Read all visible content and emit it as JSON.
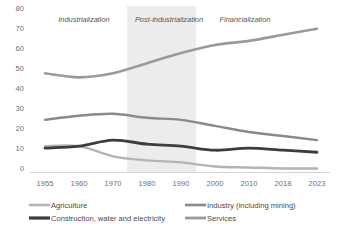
{
  "chart_data": {
    "type": "line",
    "title": "",
    "xlabel": "",
    "ylabel": "",
    "x": [
      "1955",
      "1960",
      "1970",
      "1980",
      "1990",
      "2000",
      "2010",
      "2018",
      "2023"
    ],
    "categories": [
      "1955",
      "1960",
      "1970",
      "1980",
      "1990",
      "2000",
      "2010",
      "2018",
      "2023"
    ],
    "ylim": [
      0,
      80
    ],
    "yticks": [
      "0",
      "10",
      "20",
      "30",
      "40",
      "50",
      "60",
      "70",
      "80"
    ],
    "grid": false,
    "legend_position": "bottom",
    "series": [
      {
        "name": "Agriculture",
        "color": "#b4b4b4",
        "values": [
          13,
          13,
          8,
          6,
          5,
          3,
          2.5,
          2,
          2
        ]
      },
      {
        "name": "Industry (including mining)",
        "color": "#8a8a8a",
        "values": [
          26,
          28,
          29,
          27,
          26,
          23,
          20,
          18,
          16
        ]
      },
      {
        "name": "Construction, water and electricity",
        "color": "#3c3c3c",
        "values": [
          12,
          13,
          16,
          14,
          13,
          11,
          12,
          11,
          10
        ]
      },
      {
        "name": "Services",
        "color": "#9a9a9a",
        "values": [
          49,
          47,
          49,
          54,
          59,
          63,
          65,
          68,
          71
        ]
      }
    ],
    "annotations": [
      {
        "text": "Industrialization",
        "x_center": "1962"
      },
      {
        "text": "Post-industrialization",
        "x_center": "1980"
      },
      {
        "text": "Financialization",
        "x_center": "2002"
      }
    ],
    "shaded_band": {
      "label": "Post-industrialization",
      "color": "#ececec",
      "from": "1973",
      "to": "1993"
    }
  },
  "axes": {
    "y_ticks": [
      "80",
      "70",
      "60",
      "50",
      "40",
      "30",
      "20",
      "10",
      "0"
    ],
    "x_ticks": [
      "1955",
      "1960",
      "1970",
      "1980",
      "1990",
      "2000",
      "2010",
      "2018",
      "2023"
    ]
  },
  "eras": {
    "industrialization": "Industrialization",
    "post_industrialization": "Post-industrialization",
    "financialization": "Financialization"
  },
  "legend": {
    "agriculture": "Agriculture",
    "industry": "Industry (including mining)",
    "construction": "Construction, water and electricity",
    "services": "Services"
  }
}
